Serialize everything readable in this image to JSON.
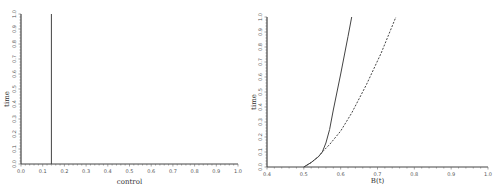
{
  "chart_data": [
    {
      "type": "line",
      "title": "",
      "xlabel": "control",
      "ylabel": "time",
      "xlim": [
        0.0,
        1.0
      ],
      "ylim": [
        0.0,
        1.0
      ],
      "x_ticks": [
        "0.0",
        "0.1",
        "0.2",
        "0.3",
        "0.4",
        "0.5",
        "0.6",
        "0.7",
        "0.8",
        "0.9",
        "1.0"
      ],
      "y_ticks": [
        "0.0",
        "0.1",
        "0.2",
        "0.3",
        "0.4",
        "0.5",
        "0.6",
        "0.7",
        "0.8",
        "0.9",
        "1.0"
      ],
      "grid": false,
      "series": [
        {
          "name": "control",
          "style": "solid",
          "x": [
            0.14,
            0.14
          ],
          "y": [
            0.0,
            1.0
          ]
        }
      ]
    },
    {
      "type": "line",
      "title": "",
      "xlabel": "B(t)",
      "ylabel": "time",
      "xlim": [
        0.4,
        1.0
      ],
      "ylim": [
        0.0,
        1.0
      ],
      "x_ticks": [
        "0.4",
        "0.5",
        "0.6",
        "0.7",
        "0.8",
        "0.9",
        "1.0"
      ],
      "y_ticks": [
        "0.0",
        "0.1",
        "0.2",
        "0.3",
        "0.4",
        "0.5",
        "0.6",
        "0.7",
        "0.8",
        "0.9",
        "1.0"
      ],
      "grid": false,
      "series": [
        {
          "name": "solid",
          "style": "solid",
          "x": [
            0.5,
            0.52,
            0.54,
            0.55,
            0.56,
            0.57,
            0.58,
            0.6,
            0.62,
            0.63
          ],
          "y": [
            0.0,
            0.03,
            0.07,
            0.1,
            0.16,
            0.25,
            0.38,
            0.62,
            0.87,
            1.0
          ]
        },
        {
          "name": "dashed",
          "style": "dashed",
          "x": [
            0.5,
            0.52,
            0.54,
            0.55,
            0.57,
            0.6,
            0.63,
            0.67,
            0.71,
            0.75
          ],
          "y": [
            0.0,
            0.03,
            0.07,
            0.1,
            0.15,
            0.24,
            0.36,
            0.55,
            0.76,
            1.0
          ]
        }
      ]
    }
  ]
}
